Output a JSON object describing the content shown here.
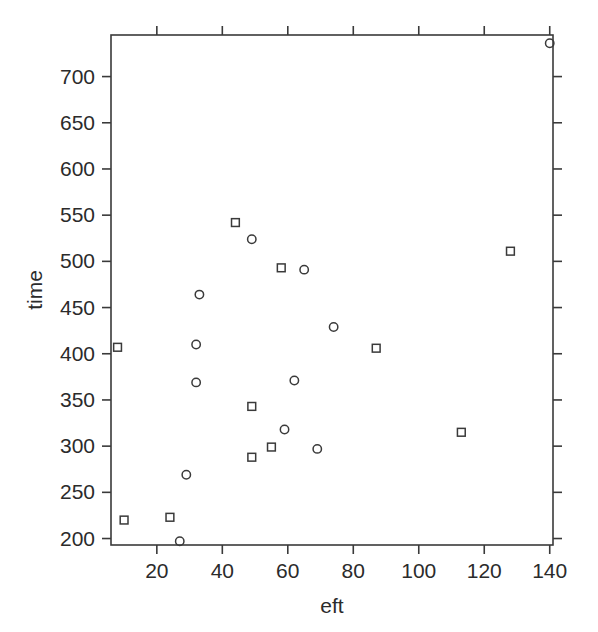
{
  "chart_data": {
    "type": "scatter",
    "title": "",
    "xlabel": "eft",
    "ylabel": "time",
    "xlim": [
      6,
      141
    ],
    "ylim": [
      193,
      745
    ],
    "xticks": [
      20,
      40,
      60,
      80,
      100,
      120,
      140
    ],
    "yticks": [
      200,
      250,
      300,
      350,
      400,
      450,
      500,
      550,
      600,
      650,
      700
    ],
    "grid": false,
    "legend": "none",
    "series": [
      {
        "name": "circle-group",
        "marker": "circle",
        "points": [
          {
            "x": 140,
            "y": 736
          },
          {
            "x": 33,
            "y": 464
          },
          {
            "x": 49,
            "y": 524
          },
          {
            "x": 65,
            "y": 491
          },
          {
            "x": 74,
            "y": 429
          },
          {
            "x": 32,
            "y": 410
          },
          {
            "x": 62,
            "y": 371
          },
          {
            "x": 32,
            "y": 369
          },
          {
            "x": 59,
            "y": 318
          },
          {
            "x": 69,
            "y": 297
          },
          {
            "x": 29,
            "y": 269
          },
          {
            "x": 27,
            "y": 197
          }
        ]
      },
      {
        "name": "square-group",
        "marker": "square",
        "points": [
          {
            "x": 44,
            "y": 542
          },
          {
            "x": 128,
            "y": 511
          },
          {
            "x": 58,
            "y": 493
          },
          {
            "x": 8,
            "y": 407
          },
          {
            "x": 87,
            "y": 406
          },
          {
            "x": 49,
            "y": 343
          },
          {
            "x": 113,
            "y": 315
          },
          {
            "x": 55,
            "y": 299
          },
          {
            "x": 49,
            "y": 288
          },
          {
            "x": 24,
            "y": 223
          },
          {
            "x": 10,
            "y": 220
          }
        ]
      }
    ]
  },
  "axes": {
    "x_title": "eft",
    "y_title": "time",
    "x_tick_labels": [
      "20",
      "40",
      "60",
      "80",
      "100",
      "120",
      "140"
    ],
    "y_tick_labels": [
      "200",
      "250",
      "300",
      "350",
      "400",
      "450",
      "500",
      "550",
      "600",
      "650",
      "700"
    ]
  },
  "style": {
    "marker_stroke": "#3a3a3a",
    "axis_color": "#3a3a3a",
    "background": "#ffffff"
  }
}
